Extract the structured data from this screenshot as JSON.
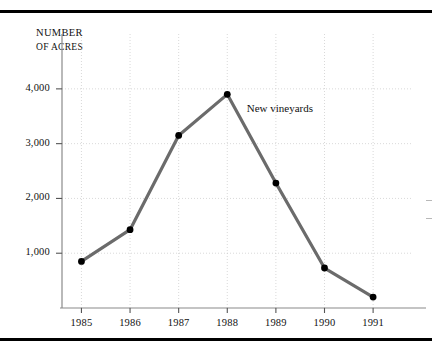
{
  "figure": {
    "axis_title_line1": "NUMBER",
    "axis_title_line2": "OF ACRES",
    "annotation": "New vineyards",
    "line_color": "#6b6b6b",
    "marker_color": "#000000",
    "grid_color": "#c9c9c9",
    "rule_color": "#000000"
  },
  "chart_data": {
    "type": "line",
    "title": "",
    "subtitle": "",
    "xlabel": "",
    "ylabel": "NUMBER OF ACRES",
    "categories": [
      "1985",
      "1986",
      "1987",
      "1988",
      "1989",
      "1990",
      "1991"
    ],
    "x": [
      1985,
      1986,
      1987,
      1988,
      1989,
      1990,
      1991
    ],
    "series": [
      {
        "name": "New vineyards",
        "values": [
          850,
          1430,
          3150,
          3900,
          2280,
          730,
          200
        ]
      }
    ],
    "values": [
      850,
      1430,
      3150,
      3900,
      2280,
      730,
      200
    ],
    "ylim": [
      0,
      4600
    ],
    "xlim": [
      1984.6,
      1991.8
    ],
    "yticks": [
      1000,
      2000,
      3000,
      4000
    ],
    "ytick_labels": [
      "1,000",
      "2,000",
      "3,000",
      "4,000"
    ],
    "xticks": [
      1985,
      1986,
      1987,
      1988,
      1989,
      1990,
      1991
    ],
    "xtick_labels": [
      "1985",
      "1986",
      "1987",
      "1988",
      "1989",
      "1990",
      "1991"
    ],
    "grid": "dotted horizontal and vertical",
    "legend": "none (inline annotation)",
    "markers": "filled black circles",
    "annotations": [
      {
        "text": "New vineyards",
        "x": 1988.4,
        "y": 3620
      }
    ]
  }
}
